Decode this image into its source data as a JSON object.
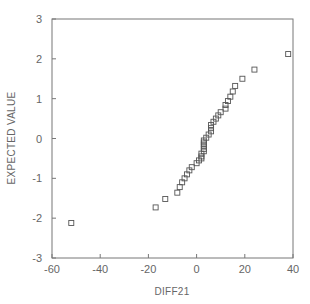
{
  "chart_data": {
    "type": "scatter",
    "title": "",
    "xlabel": "DIFF21",
    "ylabel": "EXPECTED VALUE",
    "xlim": [
      -60,
      40
    ],
    "ylim": [
      -3,
      3
    ],
    "xticks": [
      -60,
      -40,
      -20,
      0,
      20,
      40
    ],
    "yticks": [
      -3,
      -2,
      -1,
      0,
      1,
      2,
      3
    ],
    "xtick_labels": [
      "-60",
      "-40",
      "-20",
      "0",
      "20",
      "40"
    ],
    "ytick_labels": [
      "-3",
      "-2",
      "-1",
      "0",
      "1",
      "2",
      "3"
    ],
    "grid": false,
    "legend": null,
    "marker": "open-square",
    "colors": {
      "axis": "#777777",
      "marker": "#555555",
      "text": "#666666"
    },
    "series": [
      {
        "name": "DIFF21 normal probability",
        "points": [
          [
            -52,
            -2.12
          ],
          [
            -17,
            -1.73
          ],
          [
            -13,
            -1.52
          ],
          [
            -8,
            -1.36
          ],
          [
            -7,
            -1.22
          ],
          [
            -6,
            -1.1
          ],
          [
            -5,
            -1.0
          ],
          [
            -4,
            -0.9
          ],
          [
            -3,
            -0.8
          ],
          [
            -2,
            -0.72
          ],
          [
            0,
            -0.62
          ],
          [
            1,
            -0.55
          ],
          [
            2,
            -0.5
          ],
          [
            2,
            -0.45
          ],
          [
            2,
            -0.38
          ],
          [
            3,
            -0.32
          ],
          [
            3,
            -0.26
          ],
          [
            3,
            -0.2
          ],
          [
            3,
            -0.15
          ],
          [
            3,
            -0.1
          ],
          [
            3,
            -0.05
          ],
          [
            4,
            0.02
          ],
          [
            5,
            0.1
          ],
          [
            6,
            0.18
          ],
          [
            6,
            0.26
          ],
          [
            6,
            0.34
          ],
          [
            7,
            0.42
          ],
          [
            8,
            0.5
          ],
          [
            9,
            0.58
          ],
          [
            10,
            0.66
          ],
          [
            12,
            0.75
          ],
          [
            12,
            0.84
          ],
          [
            13,
            0.94
          ],
          [
            14,
            1.05
          ],
          [
            15,
            1.18
          ],
          [
            16,
            1.32
          ],
          [
            19,
            1.5
          ],
          [
            24,
            1.73
          ],
          [
            38,
            2.12
          ]
        ]
      }
    ]
  }
}
